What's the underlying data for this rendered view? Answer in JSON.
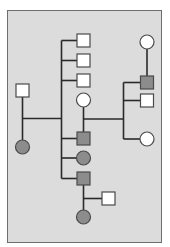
{
  "diagram": {
    "type": "pedigree",
    "colors": {
      "background": "#ffffff",
      "panel": "#dcdcdc",
      "panel_border": "#6e6e6e",
      "line": "#2a2a2a",
      "affected": "#8c8c8c",
      "unaffected": "#ffffff",
      "shape_border": "#4a4a4a"
    },
    "individuals": [
      {
        "id": "gen1-father",
        "shape": "square",
        "affected": false,
        "x": 22.5,
        "y": 90.5
      },
      {
        "id": "gen1-mother",
        "shape": "circle",
        "affected": true,
        "x": 22.5,
        "y": 147
      },
      {
        "id": "gen2-son-1",
        "shape": "square",
        "affected": false,
        "x": 83.5,
        "y": 40.5
      },
      {
        "id": "gen2-son-2",
        "shape": "square",
        "affected": false,
        "x": 83.5,
        "y": 60.5
      },
      {
        "id": "gen2-son-3",
        "shape": "square",
        "affected": false,
        "x": 83.5,
        "y": 80.5
      },
      {
        "id": "gen2-spouse-female",
        "shape": "circle",
        "affected": false,
        "x": 83.5,
        "y": 100
      },
      {
        "id": "gen2-son-4",
        "shape": "square",
        "affected": true,
        "x": 83.5,
        "y": 138.5
      },
      {
        "id": "gen2-daughter",
        "shape": "circle",
        "affected": true,
        "x": 83.5,
        "y": 158
      },
      {
        "id": "gen2-son-5",
        "shape": "square",
        "affected": true,
        "x": 83.5,
        "y": 178.5
      },
      {
        "id": "gen3-spouse-male",
        "shape": "square",
        "affected": false,
        "x": 108.5,
        "y": 198.5
      },
      {
        "id": "gen3-daughter",
        "shape": "circle",
        "affected": true,
        "x": 83.5,
        "y": 217
      },
      {
        "id": "gen3-grandmother-right",
        "shape": "circle",
        "affected": false,
        "x": 147,
        "y": 42
      },
      {
        "id": "gen3-son-affected",
        "shape": "square",
        "affected": true,
        "x": 147,
        "y": 82.5
      },
      {
        "id": "gen3-son-unaffected",
        "shape": "square",
        "affected": false,
        "x": 147,
        "y": 100.5
      },
      {
        "id": "gen3-daughter-right",
        "shape": "circle",
        "affected": false,
        "x": 147,
        "y": 139
      }
    ]
  }
}
